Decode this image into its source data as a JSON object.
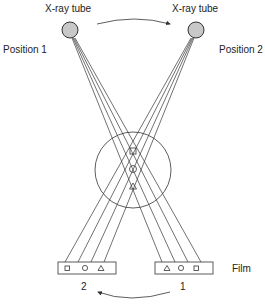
{
  "diagram": {
    "tube_left_label": "X-ray tube",
    "tube_right_label": "X-ray tube",
    "position_left_label": "Position 1",
    "position_right_label": "Position 2",
    "film_label": "Film",
    "film_left_number": "2",
    "film_right_number": "1",
    "film_left_symbols": [
      "square",
      "circle",
      "triangle"
    ],
    "film_right_symbols": [
      "triangle",
      "circle",
      "square"
    ],
    "object_symbols": [
      "square",
      "circle",
      "triangle"
    ],
    "colors": {
      "tube_fill": "#c8c8c8",
      "line": "#333333",
      "text": "#222222"
    }
  }
}
